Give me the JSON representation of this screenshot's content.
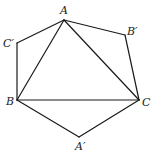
{
  "diagram": {
    "type": "geometry",
    "vertices": [
      {
        "id": "A",
        "label": "A",
        "x": 64,
        "y": 20,
        "lx": 60,
        "ly": 14
      },
      {
        "id": "Bp",
        "label": "B′",
        "x": 125,
        "y": 35,
        "lx": 127,
        "ly": 35
      },
      {
        "id": "Cp",
        "label": "C′",
        "x": 17,
        "y": 43,
        "lx": 3,
        "ly": 47
      },
      {
        "id": "B",
        "label": "B",
        "x": 17,
        "y": 100,
        "lx": 6,
        "ly": 105
      },
      {
        "id": "C",
        "label": "C",
        "x": 139,
        "y": 100,
        "lx": 142,
        "ly": 106
      },
      {
        "id": "Ap",
        "label": "A′",
        "x": 79,
        "y": 137,
        "lx": 75,
        "ly": 150
      }
    ],
    "edges": [
      [
        "A",
        "Bp"
      ],
      [
        "Bp",
        "C"
      ],
      [
        "C",
        "Ap"
      ],
      [
        "Ap",
        "B"
      ],
      [
        "B",
        "Cp"
      ],
      [
        "Cp",
        "A"
      ],
      [
        "A",
        "B"
      ],
      [
        "B",
        "C"
      ],
      [
        "C",
        "A"
      ]
    ]
  }
}
